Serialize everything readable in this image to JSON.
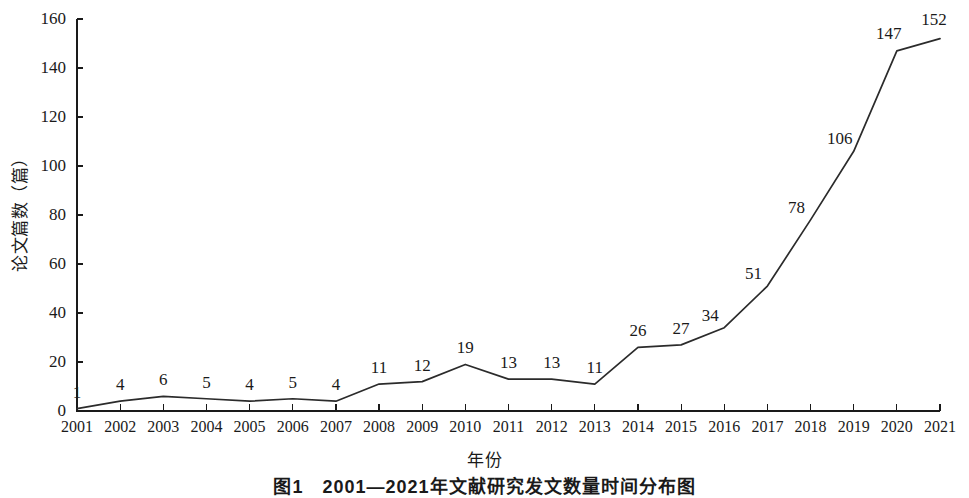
{
  "chart_data": {
    "type": "line",
    "title": "",
    "xlabel": "年份",
    "ylabel": "论文篇数（篇）",
    "categories": [
      "2001",
      "2002",
      "2003",
      "2004",
      "2005",
      "2006",
      "2007",
      "2008",
      "2009",
      "2010",
      "2011",
      "2012",
      "2013",
      "2014",
      "2015",
      "2016",
      "2017",
      "2018",
      "2019",
      "2020",
      "2021"
    ],
    "values": [
      1,
      4,
      6,
      5,
      4,
      5,
      4,
      11,
      12,
      19,
      13,
      13,
      11,
      26,
      27,
      34,
      51,
      78,
      106,
      147,
      152
    ],
    "value_labels": [
      "1",
      "4",
      "6",
      "5",
      "4",
      "5",
      "4",
      "11",
      "12",
      "19",
      "13",
      "13",
      "11",
      "26",
      "27",
      "34",
      "51",
      "78",
      "106",
      "147",
      "152"
    ],
    "ylim": [
      0,
      160
    ],
    "yticks": [
      0,
      20,
      40,
      60,
      80,
      100,
      120,
      140,
      160
    ],
    "ytick_labels": [
      "0",
      "20",
      "40",
      "60",
      "80",
      "100",
      "120",
      "140",
      "160"
    ],
    "grid": false,
    "legend": false,
    "legend_position": "none",
    "series": [
      {
        "name": "论文篇数",
        "color": "#2b2b2b",
        "values": [
          1,
          4,
          6,
          5,
          4,
          5,
          4,
          11,
          12,
          19,
          13,
          13,
          11,
          26,
          27,
          34,
          51,
          78,
          106,
          147,
          152
        ]
      }
    ],
    "line_color": "#2b2b2b",
    "axis_color": "#1a1a1a",
    "background_color": "#ffffff"
  },
  "caption": {
    "text": "图1　2001—2021年文献研究发文数量时间分布图"
  }
}
